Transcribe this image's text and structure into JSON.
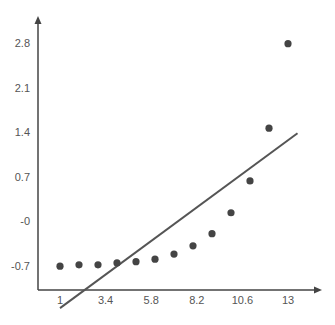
{
  "chart_data": {
    "type": "scatter",
    "title": "",
    "xlabel": "",
    "ylabel": "",
    "x_ticks": [
      1,
      3.4,
      5.8,
      8.2,
      10.6,
      13
    ],
    "x_tick_labels": [
      "1",
      "3.4",
      "5.8",
      "8.2",
      "10.6",
      "13"
    ],
    "y_ticks": [
      -0.7,
      0,
      0.7,
      1.4,
      2.1,
      2.8
    ],
    "y_tick_labels": [
      "-0.7",
      "-0",
      "0.7",
      "1.4",
      "2.1",
      "2.8"
    ],
    "xlim": [
      -0.2,
      14.5
    ],
    "ylim": [
      -1.15,
      3.3
    ],
    "grid": false,
    "legend": null,
    "series": [
      {
        "name": "points",
        "kind": "scatter",
        "color": "#444444",
        "x": [
          1,
          2,
          3,
          4,
          5,
          6,
          7,
          8,
          9,
          10,
          11,
          12,
          13
        ],
        "y": [
          -0.71,
          -0.69,
          -0.69,
          -0.66,
          -0.64,
          -0.6,
          -0.52,
          -0.39,
          -0.2,
          0.13,
          0.63,
          1.46,
          2.79
        ]
      },
      {
        "name": "fit-line",
        "kind": "line",
        "color": "#555555",
        "x": [
          1,
          13.5
        ],
        "y": [
          -1.37,
          1.38
        ]
      }
    ]
  }
}
